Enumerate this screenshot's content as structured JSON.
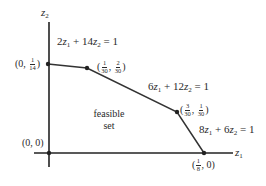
{
  "diagram": {
    "type": "feasible-region",
    "axes": {
      "x_label": {
        "var": "z",
        "sub": "1"
      },
      "y_label": {
        "var": "z",
        "sub": "2"
      }
    },
    "constraints": [
      {
        "id": "c1",
        "coef1": "2",
        "coef2": "14",
        "rhs": "1",
        "var": "z",
        "sub1": "1",
        "sub2": "2",
        "text": "2z1 + 14z2 = 1"
      },
      {
        "id": "c2",
        "coef1": "6",
        "coef2": "12",
        "rhs": "1",
        "var": "z",
        "sub1": "1",
        "sub2": "2",
        "text": "6z1 + 12z2 = 1"
      },
      {
        "id": "c3",
        "coef1": "8",
        "coef2": "6",
        "rhs": "1",
        "var": "z",
        "sub1": "1",
        "sub2": "2",
        "text": "8z1 + 6z2 = 1"
      }
    ],
    "vertices": [
      {
        "id": "v0",
        "text": "(0, 0)",
        "px": [
          49,
          153
        ]
      },
      {
        "id": "v1",
        "first": "0",
        "num2": "1",
        "den2": "14",
        "text": "(0, 1/14)",
        "px": [
          48,
          64
        ]
      },
      {
        "id": "v2",
        "num1": "1",
        "den1": "30",
        "num2": "2",
        "den2": "30",
        "text": "(1/30, 2/30)",
        "px": [
          87,
          68
        ]
      },
      {
        "id": "v3",
        "num1": "3",
        "den1": "30",
        "num2": "1",
        "den2": "30",
        "text": "(3/30, 1/30)",
        "px": [
          177,
          112
        ]
      },
      {
        "id": "v4",
        "num1": "1",
        "den1": "8",
        "second": "0",
        "text": "(1/8, 0)",
        "px": [
          204,
          153
        ]
      }
    ],
    "region_label": {
      "line1": "feasible",
      "line2": "set"
    },
    "punct": {
      "open": "(",
      "close": ")",
      "comma": ",",
      "plus": "+",
      "eq": "="
    },
    "colors": {
      "line": "#333333",
      "axis": "#222222",
      "text": "#2a2a2a"
    }
  }
}
